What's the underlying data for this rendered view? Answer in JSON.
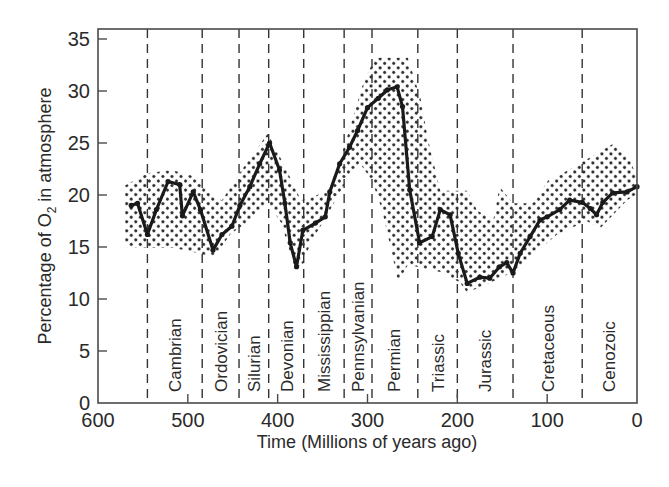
{
  "chart_data": {
    "type": "line",
    "title": "",
    "xlabel": "Time (Millions of years ago)",
    "ylabel_prefix": "Percentage of O",
    "ylabel_sub": "2",
    "ylabel_suffix": " in atmosphere",
    "ylabel": "Percentage of O2 in atmosphere",
    "xlim": [
      600,
      0
    ],
    "ylim": [
      0,
      35
    ],
    "x_ticks": [
      600,
      500,
      400,
      300,
      200,
      100,
      0
    ],
    "y_ticks": [
      0,
      5,
      10,
      15,
      20,
      25,
      30,
      35
    ],
    "grid": false,
    "legend": null,
    "series": [
      {
        "name": "O2 percentage (best estimate)",
        "x": [
          563,
          556,
          545,
          535,
          522,
          509,
          506,
          494,
          486,
          472,
          462,
          451,
          442,
          431,
          420,
          409,
          398,
          392,
          386,
          379,
          372,
          358,
          347,
          342,
          331,
          320,
          311,
          300,
          288,
          278,
          267,
          261,
          253,
          242,
          228,
          219,
          208,
          199,
          189,
          175,
          164,
          153,
          145,
          138,
          130,
          119,
          108,
          100,
          86,
          75,
          61,
          52,
          45,
          38,
          27,
          11,
          0
        ],
        "y": [
          19.0,
          19.2,
          16.2,
          18.6,
          21.3,
          21.0,
          18.0,
          20.3,
          18.6,
          14.7,
          16.2,
          17.0,
          19.0,
          20.8,
          23.0,
          25.0,
          22.4,
          19.2,
          15.4,
          13.1,
          16.6,
          17.3,
          17.9,
          20.3,
          23.0,
          24.6,
          26.2,
          28.4,
          29.3,
          30.1,
          30.4,
          28.5,
          20.5,
          15.4,
          16.0,
          18.6,
          18.1,
          14.4,
          11.5,
          12.1,
          12.0,
          13.1,
          13.5,
          12.5,
          14.4,
          16.0,
          17.6,
          17.9,
          18.6,
          19.5,
          19.3,
          18.7,
          18.1,
          19.3,
          20.2,
          20.3,
          20.8
        ]
      }
    ],
    "uncertainty_band": {
      "upper": {
        "x": [
          570,
          545,
          518,
          489,
          472,
          462,
          440,
          411,
          396,
          374,
          360,
          342,
          325,
          306,
          292,
          255,
          241,
          232,
          219,
          204,
          189,
          178,
          160,
          153,
          138,
          116,
          99,
          76,
          27,
          8,
          0
        ],
        "y": [
          20.9,
          22.1,
          22.4,
          21.7,
          19.8,
          19.5,
          22.4,
          25.9,
          23.4,
          19.5,
          19.8,
          20.7,
          24.9,
          30.4,
          33.2,
          33.2,
          29.3,
          25.1,
          20.4,
          20.4,
          20.4,
          18.5,
          17.6,
          20.8,
          19.2,
          19.2,
          21.4,
          22.4,
          24.9,
          23.5,
          21.6
        ]
      },
      "lower": {
        "x": [
          570,
          545,
          515,
          493,
          471,
          452,
          430,
          411,
          396,
          381,
          372,
          363,
          348,
          323,
          309,
          295,
          284,
          273,
          266,
          255,
          219,
          197,
          189,
          155,
          138,
          116,
          89,
          56,
          41,
          11,
          0
        ],
        "y": [
          15.0,
          14.9,
          14.9,
          14.5,
          14.0,
          16.3,
          17.6,
          19.2,
          17.3,
          13.0,
          13.3,
          15.5,
          17.6,
          21.4,
          23.1,
          21.4,
          18.6,
          14.5,
          11.6,
          13.3,
          12.6,
          11.6,
          10.6,
          11.9,
          12.6,
          14.2,
          16.2,
          17.5,
          16.8,
          19.5,
          20.1
        ]
      }
    },
    "period_boundaries": [
      545,
      484,
      443,
      410,
      371,
      326,
      295,
      244,
      200,
      138,
      61
    ],
    "periods": [
      {
        "name": "Cambrian",
        "label_x": 514
      },
      {
        "name": "Ordovician",
        "label_x": 463
      },
      {
        "name": "Silurian",
        "label_x": 426
      },
      {
        "name": "Devonian",
        "label_x": 390
      },
      {
        "name": "Mississippian",
        "label_x": 348
      },
      {
        "name": "Pennsylvanian",
        "label_x": 311
      },
      {
        "name": "Permian",
        "label_x": 270
      },
      {
        "name": "Triassic",
        "label_x": 222
      },
      {
        "name": "Jurassic",
        "label_x": 169
      },
      {
        "name": "Cretaceous",
        "label_x": 99
      },
      {
        "name": "Cenozoic",
        "label_x": 31
      }
    ]
  }
}
